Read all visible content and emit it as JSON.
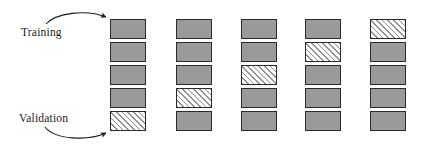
{
  "figure": {
    "kind": "k-fold-cross-validation-diagram",
    "labels": {
      "training": "Training",
      "validation": "Validation"
    },
    "colors": {
      "train_fill": "#9a9a9a",
      "validation_fill": "#f2f2f2",
      "hatch_stroke": "#8f8f8f",
      "border": "#2b2b2b",
      "arrow": "#1a1a1a",
      "background": "#ffffff"
    },
    "geometry": {
      "cell_width": 36,
      "cell_height": 20,
      "cell_gap": 3,
      "top": 19,
      "column_x": [
        110,
        176,
        241,
        305,
        370
      ]
    },
    "arrows": [
      {
        "name": "training-arrow",
        "from_label": "Training",
        "target_cell": "fold-1-cell-1",
        "direction": "curves-up-right-to-top-cell"
      },
      {
        "name": "validation-arrow",
        "from_label": "Validation",
        "target_cell": "fold-1-cell-5",
        "direction": "curves-down-right-to-bottom-cell"
      }
    ],
    "folds": [
      {
        "index": 1,
        "validation_position": 5,
        "cells": [
          "train",
          "train",
          "train",
          "train",
          "validate"
        ]
      },
      {
        "index": 2,
        "validation_position": 4,
        "cells": [
          "train",
          "train",
          "train",
          "validate",
          "train"
        ]
      },
      {
        "index": 3,
        "validation_position": 3,
        "cells": [
          "train",
          "train",
          "validate",
          "train",
          "train"
        ]
      },
      {
        "index": 4,
        "validation_position": 2,
        "cells": [
          "train",
          "validate",
          "train",
          "train",
          "train"
        ]
      },
      {
        "index": 5,
        "validation_position": 1,
        "cells": [
          "validate",
          "train",
          "train",
          "train",
          "train"
        ]
      }
    ]
  }
}
